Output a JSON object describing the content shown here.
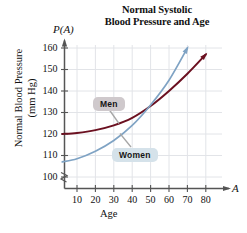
{
  "chart_data": {
    "type": "line",
    "title": "Normal Systolic Blood Pressure and Age",
    "title_line1": "Normal Systolic",
    "title_line2": "Blood Pressure and Age",
    "function_label": "P(A)",
    "xlabel": "Age",
    "x_axis_variable": "A",
    "ylabel": "Normal Blood Pressure (mm Hg)",
    "ylabel_line1": "Normal Blood Pressure",
    "ylabel_line2": "(mm Hg)",
    "xticks": [
      10,
      20,
      30,
      40,
      50,
      60,
      70,
      80
    ],
    "yticks": [
      100,
      110,
      120,
      130,
      140,
      150,
      160
    ],
    "xlim": [
      0,
      85
    ],
    "ylim": [
      95,
      163
    ],
    "grid": true,
    "legend": "inline-callout-labels",
    "axis_break_y": true,
    "series": [
      {
        "name": "Men",
        "color": "#6b1020",
        "x": [
          2,
          10,
          20,
          30,
          40,
          50,
          60,
          70,
          80
        ],
        "values": [
          120.0,
          120.5,
          121.8,
          124.0,
          127.5,
          133.0,
          140.0,
          148.0,
          157.0
        ],
        "arrow_end": true
      },
      {
        "name": "Women",
        "color": "#7fa3c4",
        "x": [
          2,
          10,
          20,
          30,
          40,
          50,
          60,
          70
        ],
        "values": [
          107.0,
          108.5,
          112.0,
          117.0,
          124.0,
          133.5,
          145.0,
          160.0
        ],
        "arrow_end": true
      }
    ],
    "annotations": [
      {
        "label": "Men",
        "target_series": "Men",
        "box_color": "#cfc9cc"
      },
      {
        "label": "Women",
        "target_series": "Women",
        "box_color": "#d5e2ea"
      }
    ],
    "colors": {
      "men_curve": "#6b1020",
      "women_curve": "#7fa3c4",
      "grid": "#e2e4e8",
      "axis": "#555555",
      "background": "#ffffff"
    }
  }
}
